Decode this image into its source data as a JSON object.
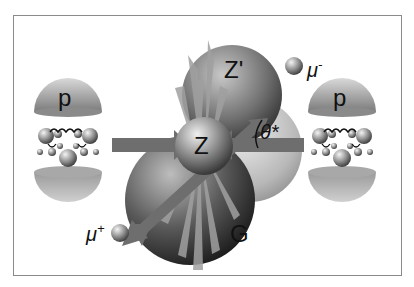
{
  "diagram": {
    "labels": {
      "proton_left": "p",
      "proton_right": "p",
      "z_boson": "Z",
      "z_prime": "Z'",
      "graviton": "G",
      "mu_minus": "μ",
      "mu_minus_sup": "-",
      "mu_plus": "μ",
      "mu_plus_sup": "+",
      "theta_star": "θ*"
    },
    "colors": {
      "background": "#ffffff",
      "frame": "#8a8a8a",
      "arrow": "#6e6e6e",
      "sphere_dark": "#2a2a2a",
      "sphere_light": "#d8d8d8",
      "spikes": "#9a9a9a"
    }
  }
}
